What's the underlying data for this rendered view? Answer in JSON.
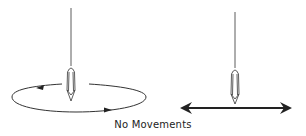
{
  "diagram": {
    "caption": "No Movements",
    "figures": [
      {
        "name": "circular-motion",
        "description": "Pendulum over elliptical path with arrows (counter-clockwise)"
      },
      {
        "name": "linear-motion",
        "description": "Pendulum over horizontal double-headed arrow"
      }
    ],
    "stroke_color": "#222222"
  }
}
